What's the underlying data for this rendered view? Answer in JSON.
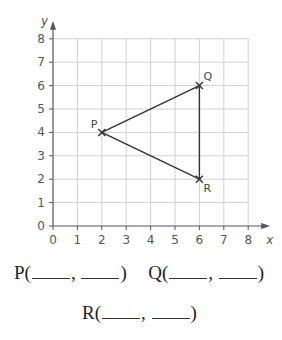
{
  "chart_data": {
    "type": "scatter",
    "title": "",
    "xlabel": "x",
    "ylabel": "y",
    "xlim": [
      0,
      8
    ],
    "ylim": [
      0,
      8
    ],
    "x_ticks": [
      "0",
      "1",
      "2",
      "3",
      "4",
      "5",
      "6",
      "7",
      "8"
    ],
    "y_ticks": [
      "0",
      "1",
      "2",
      "3",
      "4",
      "5",
      "6",
      "7",
      "8"
    ],
    "grid": true,
    "points": [
      {
        "label": "P",
        "x": 2,
        "y": 4
      },
      {
        "label": "Q",
        "x": 6,
        "y": 6
      },
      {
        "label": "R",
        "x": 6,
        "y": 2
      }
    ],
    "segments": [
      [
        "P",
        "Q"
      ],
      [
        "Q",
        "R"
      ],
      [
        "R",
        "P"
      ]
    ],
    "marker": "x",
    "colors": {
      "grid": "#d0d0d0",
      "axis": "#555555",
      "line": "#333333"
    }
  },
  "answers": {
    "row1": [
      {
        "label": "P(",
        "sep": ",",
        "close": ")"
      },
      {
        "label": "Q(",
        "sep": ",",
        "close": ")"
      }
    ],
    "row2": [
      {
        "label": "R(",
        "sep": ",",
        "close": ")"
      }
    ]
  }
}
